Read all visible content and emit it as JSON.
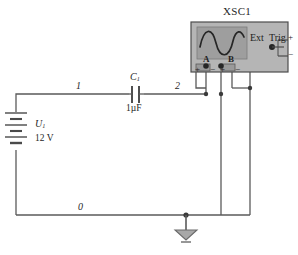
{
  "diagram": {
    "title_instrument": "XSC1",
    "background": "#ffffff",
    "wire_color": "#4a4a4a",
    "instrument_body_color": "#b8b8b8",
    "instrument_screen_color": "#9c9c9c",
    "trace_color": "#2b2b2b"
  },
  "nodes": [
    {
      "id": "n1",
      "label": "1"
    },
    {
      "id": "n2",
      "label": "2"
    },
    {
      "id": "n0",
      "label": "0"
    }
  ],
  "components": [
    {
      "id": "source",
      "kind": "dc-voltage-source",
      "name": "U",
      "name_sub": "1",
      "value": "12 V"
    },
    {
      "id": "capacitor",
      "kind": "capacitor",
      "name": "C",
      "name_sub": "1",
      "value": "1µF"
    },
    {
      "id": "ground",
      "kind": "ground",
      "name": "",
      "value": ""
    }
  ],
  "instrument": {
    "name": "XSC1",
    "type": "oscilloscope",
    "terminals": [
      {
        "id": "A",
        "label": "A",
        "plus": "+",
        "minus": "−"
      },
      {
        "id": "B",
        "label": "B",
        "plus": "+",
        "minus": "−"
      }
    ],
    "ext_trig": {
      "label_ext": "Ext",
      "label_trig": "Trig",
      "plus": "+",
      "minus": "−"
    }
  }
}
